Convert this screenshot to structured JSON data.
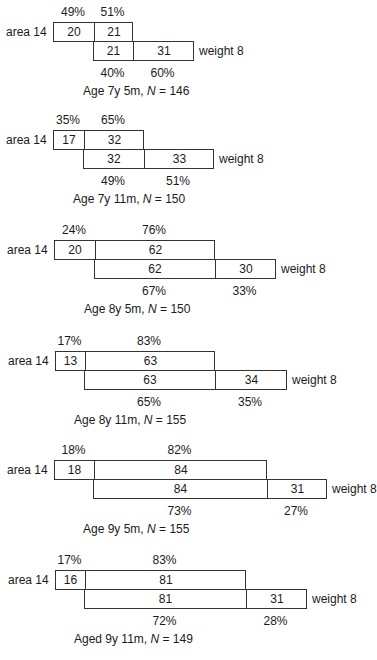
{
  "row_labels": {
    "top": "area 14",
    "bottom": "weight 8"
  },
  "panels": [
    {
      "caption_prefix": "Age 7y 5m, ",
      "caption_n": "N",
      "caption_suffix": " = 146",
      "top": {
        "left_pct": "49%",
        "right_pct": "51%",
        "left_val": "20",
        "mid_val": "21"
      },
      "bottom": {
        "mid_val": "21",
        "right_val": "31",
        "mid_pct": "40%",
        "right_pct": "60%"
      },
      "geom": {
        "y": 22,
        "x0": 53,
        "x1": 93,
        "x2": 132,
        "x3": 193
      }
    },
    {
      "caption_prefix": "Age 7y 11m, ",
      "caption_n": "N",
      "caption_suffix": " = 150",
      "top": {
        "left_pct": "35%",
        "right_pct": "65%",
        "left_val": "17",
        "mid_val": "32"
      },
      "bottom": {
        "mid_val": "32",
        "right_val": "33",
        "mid_pct": "49%",
        "right_pct": "51%"
      },
      "geom": {
        "y": 130,
        "x0": 53,
        "x1": 83,
        "x2": 143,
        "x3": 213
      }
    },
    {
      "caption_prefix": "Age 8y 5m, ",
      "caption_n": "N",
      "caption_suffix": " = 150",
      "top": {
        "left_pct": "24%",
        "right_pct": "76%",
        "left_val": "20",
        "mid_val": "62"
      },
      "bottom": {
        "mid_val": "62",
        "right_val": "30",
        "mid_pct": "67%",
        "right_pct": "33%"
      },
      "geom": {
        "y": 240,
        "x0": 54,
        "x1": 94,
        "x2": 214,
        "x3": 275
      }
    },
    {
      "caption_prefix": "Age 8y 11m, ",
      "caption_n": "N",
      "caption_suffix": " = 155",
      "top": {
        "left_pct": "17%",
        "right_pct": "83%",
        "left_val": "13",
        "mid_val": "63"
      },
      "bottom": {
        "mid_val": "63",
        "right_val": "34",
        "mid_pct": "65%",
        "right_pct": "35%"
      },
      "geom": {
        "y": 351,
        "x0": 55,
        "x1": 84,
        "x2": 214,
        "x3": 286
      }
    },
    {
      "caption_prefix": "Age 9y 5m, ",
      "caption_n": "N",
      "caption_suffix": " = 155",
      "top": {
        "left_pct": "18%",
        "right_pct": "82%",
        "left_val": "18",
        "mid_val": "84"
      },
      "bottom": {
        "mid_val": "84",
        "right_val": "31",
        "mid_pct": "73%",
        "right_pct": "27%"
      },
      "geom": {
        "y": 460,
        "x0": 54,
        "x1": 93,
        "x2": 266,
        "x3": 326
      }
    },
    {
      "caption_prefix": "Aged 9y 11m, ",
      "caption_n": "N",
      "caption_suffix": " = 149",
      "top": {
        "left_pct": "17%",
        "right_pct": "83%",
        "left_val": "16",
        "mid_val": "81"
      },
      "bottom": {
        "mid_val": "81",
        "right_val": "31",
        "mid_pct": "72%",
        "right_pct": "28%"
      },
      "geom": {
        "y": 570,
        "x0": 55,
        "x1": 84,
        "x2": 245,
        "x3": 306
      }
    }
  ],
  "colors": {
    "ink": "#1a1a1a",
    "line": "#333333",
    "background": "#ffffff"
  }
}
